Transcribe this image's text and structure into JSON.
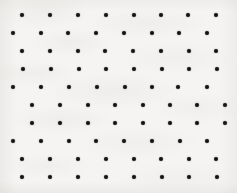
{
  "figure": {
    "kind": "dot-lattice",
    "width": 237,
    "height": 193,
    "background_color": "#f5f4f2",
    "dot_color": "#141414",
    "dot_diameter": 4,
    "row_count": 10,
    "dots_per_row": 8,
    "row_pitch": 18,
    "column_pitch": 28
  },
  "chart_data": {
    "type": "scatter",
    "xlabel": "",
    "ylabel": "",
    "xlim": [
      0,
      237
    ],
    "ylim": [
      0,
      193
    ],
    "grid": false,
    "legend": "none",
    "marker": "circle",
    "marker_size": 4,
    "marker_color": "#141414",
    "series": [
      {
        "name": "row-1",
        "y": 15,
        "x": [
          22,
          50,
          78,
          106,
          134,
          161,
          188,
          216
        ]
      },
      {
        "name": "row-2",
        "y": 33,
        "x": [
          13,
          41,
          68,
          96,
          124,
          152,
          179,
          207
        ]
      },
      {
        "name": "row-3",
        "y": 51,
        "x": [
          22,
          50,
          78,
          105,
          133,
          161,
          189,
          216
        ]
      },
      {
        "name": "row-4",
        "y": 69,
        "x": [
          23,
          51,
          79,
          106,
          134,
          162,
          189,
          217
        ]
      },
      {
        "name": "row-5",
        "y": 87,
        "x": [
          13,
          41,
          69,
          97,
          125,
          152,
          178,
          207
        ]
      },
      {
        "name": "row-6",
        "y": 105,
        "x": [
          32,
          60,
          88,
          115,
          143,
          170,
          197,
          225
        ]
      },
      {
        "name": "row-7",
        "y": 123,
        "x": [
          32,
          60,
          88,
          115,
          143,
          170,
          197,
          225
        ]
      },
      {
        "name": "row-8",
        "y": 141,
        "x": [
          13,
          41,
          69,
          96,
          124,
          152,
          180,
          207
        ]
      },
      {
        "name": "row-9",
        "y": 159,
        "x": [
          22,
          50,
          78,
          106,
          134,
          161,
          189,
          216
        ]
      },
      {
        "name": "row-10",
        "y": 177,
        "x": [
          22,
          50,
          78,
          106,
          134,
          162,
          189,
          217
        ]
      }
    ]
  }
}
